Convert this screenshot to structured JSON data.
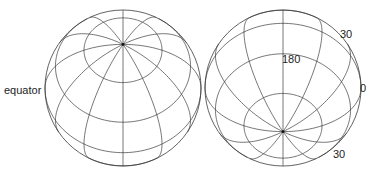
{
  "title": "",
  "globes": [
    {
      "id": "left-globe",
      "cx": 123,
      "cy": 88,
      "r": 78,
      "view_lat": 56,
      "pole": "top",
      "labels": [
        {
          "text": "equator",
          "x": 4,
          "y": 94,
          "anchor": "start"
        }
      ]
    },
    {
      "id": "right-globe",
      "cx": 283,
      "cy": 88,
      "r": 78,
      "view_lat": -56,
      "pole": "bottom",
      "labels": [
        {
          "text": "180",
          "x": 283,
          "y": 62,
          "anchor": "start"
        },
        {
          "text": "30",
          "x": 340,
          "y": 38,
          "anchor": "start"
        },
        {
          "text": "0",
          "x": 360,
          "y": 91,
          "anchor": "start"
        },
        {
          "text": "30",
          "x": 332,
          "y": 158,
          "anchor": "start"
        }
      ]
    }
  ],
  "grid": {
    "latitudes": [
      -60,
      -30,
      0,
      30,
      60
    ],
    "meridian_step": 30
  },
  "labels": {
    "equator": "equator",
    "lon_180": "180",
    "lat_30_top": "30",
    "lon_0": "0",
    "lat_30_bottom": "30"
  }
}
